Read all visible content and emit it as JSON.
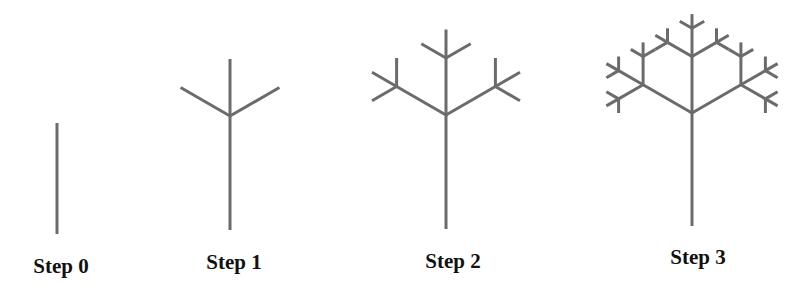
{
  "figure": {
    "line_color": "#6b6b6b",
    "label_color": "#111111",
    "branch_rule": {
      "children_angles_deg": [
        -60,
        0,
        60
      ],
      "length_ratio": 0.5
    },
    "steps": [
      {
        "label": "Step 0",
        "depth": 0,
        "base": [
          57,
          234
        ],
        "trunk_length": 111,
        "label_x": 61,
        "label_top": 256
      },
      {
        "label": "Step 1",
        "depth": 1,
        "base": [
          230,
          230
        ],
        "trunk_length": 114,
        "label_x": 234,
        "label_top": 252
      },
      {
        "label": "Step 2",
        "depth": 2,
        "base": [
          446,
          229
        ],
        "trunk_length": 114,
        "label_x": 453,
        "label_top": 251
      },
      {
        "label": "Step 3",
        "depth": 3,
        "base": [
          692,
          226
        ],
        "trunk_length": 113,
        "label_x": 698,
        "label_top": 247
      }
    ]
  }
}
